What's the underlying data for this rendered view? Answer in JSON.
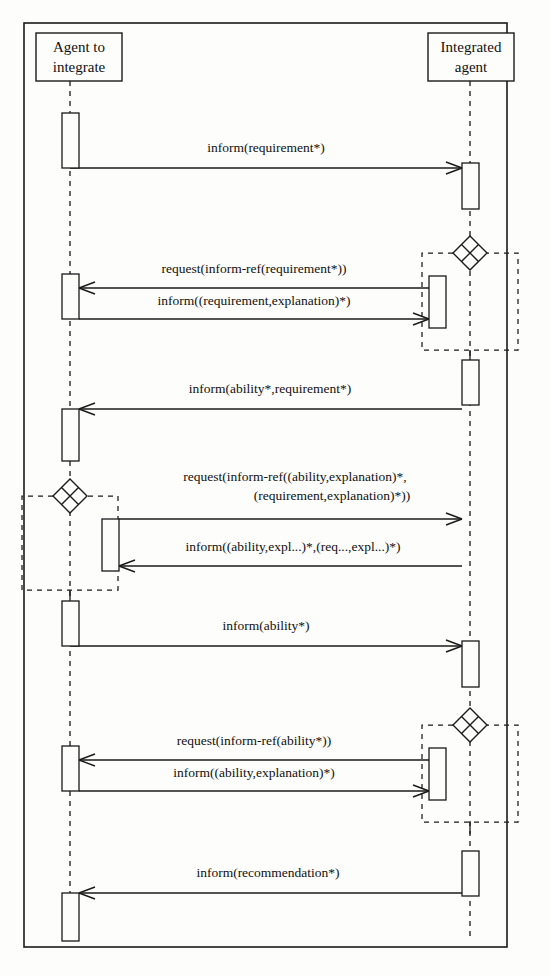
{
  "diagram": {
    "type": "uml-sequence-diagram",
    "frame": {
      "x": 24,
      "y": 23,
      "width": 483,
      "height": 924
    },
    "colors": {
      "stroke": "#1a1a1a",
      "background": "#fdfdfb",
      "text": "#111111"
    }
  },
  "lifelines": [
    {
      "id": "agent-to-integrate",
      "label_line1": "Agent to",
      "label_line2": "integrate",
      "box": {
        "x": 36,
        "y": 33,
        "width": 86,
        "height": 48
      },
      "axis_x": 70
    },
    {
      "id": "integrated-agent",
      "label_line1": "Integrated",
      "label_line2": "agent",
      "box": {
        "x": 428,
        "y": 33,
        "width": 86,
        "height": 48
      },
      "axis_x": 470
    }
  ],
  "activations": [
    {
      "id": "act-left-1",
      "lifeline": "agent-to-integrate",
      "x": 62,
      "y": 113,
      "width": 17,
      "height": 55
    },
    {
      "id": "act-right-1",
      "lifeline": "integrated-agent",
      "x": 462,
      "y": 163,
      "width": 17,
      "height": 46
    },
    {
      "id": "act-right-2-nested",
      "lifeline": "integrated-agent",
      "x": 429,
      "y": 276,
      "width": 17,
      "height": 52
    },
    {
      "id": "act-left-2",
      "lifeline": "agent-to-integrate",
      "x": 62,
      "y": 274,
      "width": 17,
      "height": 45
    },
    {
      "id": "act-right-3",
      "lifeline": "integrated-agent",
      "x": 462,
      "y": 360,
      "width": 17,
      "height": 45
    },
    {
      "id": "act-left-3",
      "lifeline": "agent-to-integrate",
      "x": 62,
      "y": 409,
      "width": 17,
      "height": 52
    },
    {
      "id": "act-left-4-nested",
      "lifeline": "agent-to-integrate",
      "x": 102,
      "y": 519,
      "width": 17,
      "height": 52
    },
    {
      "id": "act-left-5",
      "lifeline": "agent-to-integrate",
      "x": 62,
      "y": 601,
      "width": 17,
      "height": 45
    },
    {
      "id": "act-right-4",
      "lifeline": "integrated-agent",
      "x": 462,
      "y": 641,
      "width": 17,
      "height": 46
    },
    {
      "id": "act-right-5-nested",
      "lifeline": "integrated-agent",
      "x": 429,
      "y": 748,
      "width": 17,
      "height": 52
    },
    {
      "id": "act-left-6",
      "lifeline": "agent-to-integrate",
      "x": 62,
      "y": 746,
      "width": 17,
      "height": 45
    },
    {
      "id": "act-right-6",
      "lifeline": "integrated-agent",
      "x": 462,
      "y": 851,
      "width": 17,
      "height": 45
    },
    {
      "id": "act-left-7",
      "lifeline": "agent-to-integrate",
      "x": 62,
      "y": 893,
      "width": 17,
      "height": 48
    }
  ],
  "branch_nodes": [
    {
      "id": "branch-1",
      "glyph": "x-diamond",
      "side": "right",
      "cx": 470,
      "cy": 253,
      "r": 17,
      "frame": {
        "x": 422,
        "y": 253,
        "width": 96,
        "height": 97
      }
    },
    {
      "id": "branch-2",
      "glyph": "x-diamond",
      "side": "left",
      "cx": 70,
      "cy": 496,
      "r": 17,
      "frame": {
        "x": 22,
        "y": 496,
        "width": 96,
        "height": 94
      }
    },
    {
      "id": "branch-3",
      "glyph": "x-diamond",
      "side": "right",
      "cx": 470,
      "cy": 725,
      "r": 17,
      "frame": {
        "x": 422,
        "y": 725,
        "width": 96,
        "height": 97
      }
    }
  ],
  "messages": [
    {
      "id": "msg-1",
      "label": "inform(requirement*)",
      "direction": "right",
      "from_x": 70,
      "to_x": 462,
      "y": 168,
      "label_x": 266,
      "label_y": 152
    },
    {
      "id": "msg-2",
      "label": "request(inform-ref(requirement*))",
      "direction": "left",
      "from_x": 429,
      "to_x": 79,
      "y": 288,
      "label_x": 254,
      "label_y": 273
    },
    {
      "id": "msg-3",
      "label": "inform((requirement,explanation)*)",
      "direction": "right",
      "from_x": 79,
      "to_x": 429,
      "y": 319,
      "label_x": 254,
      "label_y": 305
    },
    {
      "id": "msg-4",
      "label": "inform(ability*,requirement*)",
      "direction": "left",
      "from_x": 462,
      "to_x": 79,
      "y": 409,
      "label_x": 270,
      "label_y": 393
    },
    {
      "id": "msg-5",
      "label": "request(inform-ref((ability,explanation)*,",
      "label_line2": "(requirement,explanation)*))",
      "direction": "right",
      "from_x": 119,
      "to_x": 462,
      "y": 519,
      "label_x": 295,
      "label_y": 481,
      "label2_x": 332,
      "label2_y": 500
    },
    {
      "id": "msg-6",
      "label": "inform((ability,expl...)*,(req...,expl...)*)",
      "direction": "left",
      "from_x": 462,
      "to_x": 119,
      "y": 566,
      "label_x": 293,
      "label_y": 551
    },
    {
      "id": "msg-7",
      "label": "inform(ability*)",
      "direction": "right",
      "from_x": 70,
      "to_x": 462,
      "y": 646,
      "label_x": 266,
      "label_y": 630
    },
    {
      "id": "msg-8",
      "label": "request(inform-ref(ability*))",
      "direction": "left",
      "from_x": 429,
      "to_x": 79,
      "y": 760,
      "label_x": 254,
      "label_y": 745
    },
    {
      "id": "msg-9",
      "label": "inform((ability,explanation)*)",
      "direction": "right",
      "from_x": 79,
      "to_x": 429,
      "y": 791,
      "label_x": 254,
      "label_y": 777
    },
    {
      "id": "msg-10",
      "label": "inform(recommendation*)",
      "direction": "left",
      "from_x": 462,
      "to_x": 79,
      "y": 893,
      "label_x": 268,
      "label_y": 877
    }
  ]
}
